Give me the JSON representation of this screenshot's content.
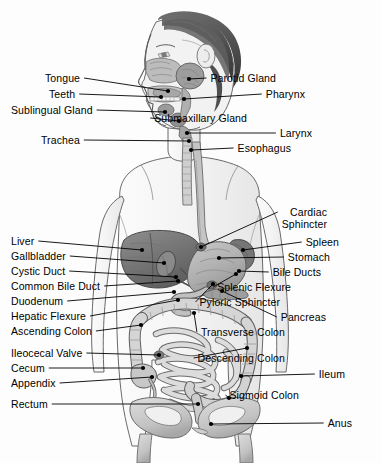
{
  "figure": {
    "width": 381,
    "height": 463,
    "background_color": "#fdfdfd",
    "line_color": "#000000",
    "text_color": "#000000"
  },
  "labels_left": [
    {
      "id": "tongue",
      "text": "Tongue",
      "x": 45,
      "y": 78,
      "line_to_x": 168,
      "line_to_y": 91
    },
    {
      "id": "teeth",
      "text": "Teeth",
      "x": 49,
      "y": 94,
      "line_to_x": 161,
      "line_to_y": 97
    },
    {
      "id": "sublingual-gland",
      "text": "Sublingual Gland",
      "x": 11,
      "y": 110,
      "line_to_x": 165,
      "line_to_y": 112
    },
    {
      "id": "trachea",
      "text": "Trachea",
      "x": 41,
      "y": 140,
      "line_to_x": 189,
      "line_to_y": 141
    },
    {
      "id": "liver",
      "text": "Liver",
      "x": 11,
      "y": 241,
      "line_to_x": 142,
      "line_to_y": 250
    },
    {
      "id": "gallbladder",
      "text": "Gallbladder",
      "x": 11,
      "y": 256,
      "line_to_x": 164,
      "line_to_y": 263
    },
    {
      "id": "cystic-duct",
      "text": "Cystic Duct",
      "x": 11,
      "y": 271,
      "line_to_x": 176,
      "line_to_y": 277
    },
    {
      "id": "common-bile-duct",
      "text": "Common Bile Duct",
      "x": 11,
      "y": 286,
      "line_to_x": 178,
      "line_to_y": 281
    },
    {
      "id": "duodenum",
      "text": "Duodenum",
      "x": 11,
      "y": 301,
      "line_to_x": 174,
      "line_to_y": 292
    },
    {
      "id": "hepatic-flexure",
      "text": "Hepatic Flexure",
      "x": 11,
      "y": 316,
      "line_to_x": 178,
      "line_to_y": 300
    },
    {
      "id": "ascending-colon",
      "text": "Ascending Colon",
      "x": 11,
      "y": 331,
      "line_to_x": 141,
      "line_to_y": 325
    },
    {
      "id": "ileocecal-valve",
      "text": "Ileocecal Valve",
      "x": 11,
      "y": 353,
      "line_to_x": 159,
      "line_to_y": 355
    },
    {
      "id": "cecum",
      "text": "Cecum",
      "x": 11,
      "y": 368,
      "line_to_x": 143,
      "line_to_y": 368
    },
    {
      "id": "appendix",
      "text": "Appendix",
      "x": 11,
      "y": 383,
      "line_to_x": 152,
      "line_to_y": 377
    },
    {
      "id": "rectum",
      "text": "Rectum",
      "x": 11,
      "y": 404,
      "line_to_x": 198,
      "line_to_y": 404
    }
  ],
  "labels_right": [
    {
      "id": "parotid-gland",
      "text": "Parotid Gland",
      "x": 276,
      "y": 78,
      "line_to_x": 189,
      "line_to_y": 79
    },
    {
      "id": "pharynx",
      "text": "Pharynx",
      "x": 305,
      "y": 94,
      "line_to_x": 184,
      "line_to_y": 99
    },
    {
      "id": "submaxillary-gland",
      "text": "Submaxillary Gland",
      "x": 247,
      "y": 118,
      "line_to_x": 179,
      "line_to_y": 121
    },
    {
      "id": "larynx",
      "text": "Larynx",
      "x": 312,
      "y": 133,
      "line_to_x": 187,
      "line_to_y": 133
    },
    {
      "id": "esophagus",
      "text": "Esophagus",
      "x": 291,
      "y": 148,
      "line_to_x": 191,
      "line_to_y": 150
    },
    {
      "id": "cardiac-sphincter",
      "text": "Cardiac",
      "text2": "Sphincter",
      "x": 327,
      "y": 212,
      "line_to_x": 201,
      "line_to_y": 247
    },
    {
      "id": "spleen",
      "text": "Spleen",
      "x": 339,
      "y": 242,
      "line_to_x": 243,
      "line_to_y": 250
    },
    {
      "id": "stomach",
      "text": "Stomach",
      "x": 330,
      "y": 257,
      "line_to_x": 219,
      "line_to_y": 258
    },
    {
      "id": "bile-ducts",
      "text": "Bile Ducts",
      "x": 321,
      "y": 272,
      "line_to_x": 239,
      "line_to_y": 271
    },
    {
      "id": "splenic-flexure",
      "text": "Splenic Flexure",
      "x": 291,
      "y": 287,
      "line_to_x": 236,
      "line_to_y": 274
    },
    {
      "id": "pyloric-sphincter",
      "text": "Pyloric Sphincter",
      "x": 280,
      "y": 302,
      "line_to_x": 213,
      "line_to_y": 284
    },
    {
      "id": "pancreas",
      "text": "Pancreas",
      "x": 326,
      "y": 317,
      "line_to_x": 222,
      "line_to_y": 291
    },
    {
      "id": "transverse-colon",
      "text": "Transverse Colon",
      "x": 285,
      "y": 332,
      "line_to_x": 194,
      "line_to_y": 313
    },
    {
      "id": "descending-colon",
      "text": "Descending Colon",
      "x": 285,
      "y": 358,
      "line_to_x": 247,
      "line_to_y": 348
    },
    {
      "id": "ileum",
      "text": "Ileum",
      "x": 345,
      "y": 374,
      "line_to_x": 241,
      "line_to_y": 376
    },
    {
      "id": "sigmoid-colon",
      "text": "Sigmoid Colon",
      "x": 299,
      "y": 395,
      "line_to_x": 229,
      "line_to_y": 398
    },
    {
      "id": "anus",
      "text": "Anus",
      "x": 352,
      "y": 423,
      "line_to_x": 211,
      "line_to_y": 424
    }
  ]
}
